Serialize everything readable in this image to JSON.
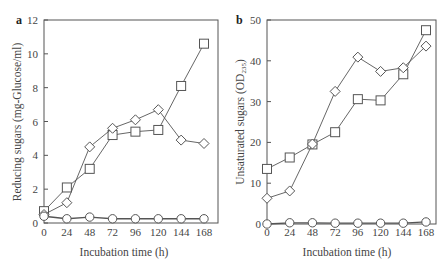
{
  "chart_data": [
    {
      "panel": "a",
      "type": "line",
      "title": "",
      "xlabel": "Incubation time (h)",
      "ylabel": "Reducing sugars (mg-Glucose/ml)",
      "x": [
        0,
        24,
        48,
        72,
        96,
        120,
        144,
        168
      ],
      "xticks": [
        "0",
        "24",
        "48",
        "72",
        "96",
        "120",
        "144",
        "168"
      ],
      "yticks": [
        "0",
        "2",
        "4",
        "6",
        "8",
        "10",
        "12"
      ],
      "ylim": [
        0,
        12
      ],
      "grid": false,
      "legend": null,
      "series": [
        {
          "name": "square",
          "marker": "square",
          "values": [
            0.7,
            2.1,
            3.2,
            5.2,
            5.4,
            5.5,
            8.1,
            10.6
          ]
        },
        {
          "name": "diamond",
          "marker": "diamond",
          "values": [
            0.5,
            1.2,
            4.5,
            5.6,
            6.1,
            6.7,
            4.9,
            4.7
          ]
        },
        {
          "name": "circle",
          "marker": "circle",
          "values": [
            0.4,
            0.25,
            0.35,
            0.25,
            0.25,
            0.25,
            0.25,
            0.25
          ]
        }
      ]
    },
    {
      "panel": "b",
      "type": "line",
      "title": "",
      "xlabel": "Incubation time (h)",
      "ylabel": "Unsaturated sugars (OD235)",
      "x": [
        0,
        24,
        48,
        72,
        96,
        120,
        144,
        168
      ],
      "xticks": [
        "0",
        "24",
        "48",
        "72",
        "96",
        "120",
        "144",
        "168"
      ],
      "yticks": [
        "0",
        "10",
        "20",
        "30",
        "40",
        "50"
      ],
      "ylim": [
        0,
        50
      ],
      "grid": false,
      "legend": null,
      "series": [
        {
          "name": "square",
          "marker": "square",
          "values": [
            13.5,
            16.3,
            19.5,
            22.5,
            30.6,
            30.3,
            36.7,
            47.5
          ]
        },
        {
          "name": "diamond",
          "marker": "diamond",
          "values": [
            6.3,
            8.1,
            19.6,
            32.5,
            40.9,
            37.4,
            38.3,
            43.6
          ]
        },
        {
          "name": "circle",
          "marker": "circle",
          "values": [
            0.0,
            0.3,
            0.3,
            0.2,
            0.2,
            0.2,
            0.2,
            0.5
          ]
        }
      ]
    }
  ],
  "panels": {
    "a": {
      "label": "a",
      "xlabel": "Incubation time (h)",
      "ylabel": "Reducing sugars (mg-Glucose/ml)"
    },
    "b": {
      "label": "b",
      "xlabel": "Incubation time (h)",
      "ylabel_main": "Unsaturated sugars (OD",
      "ylabel_sub": "235",
      "ylabel_end": ")"
    }
  }
}
